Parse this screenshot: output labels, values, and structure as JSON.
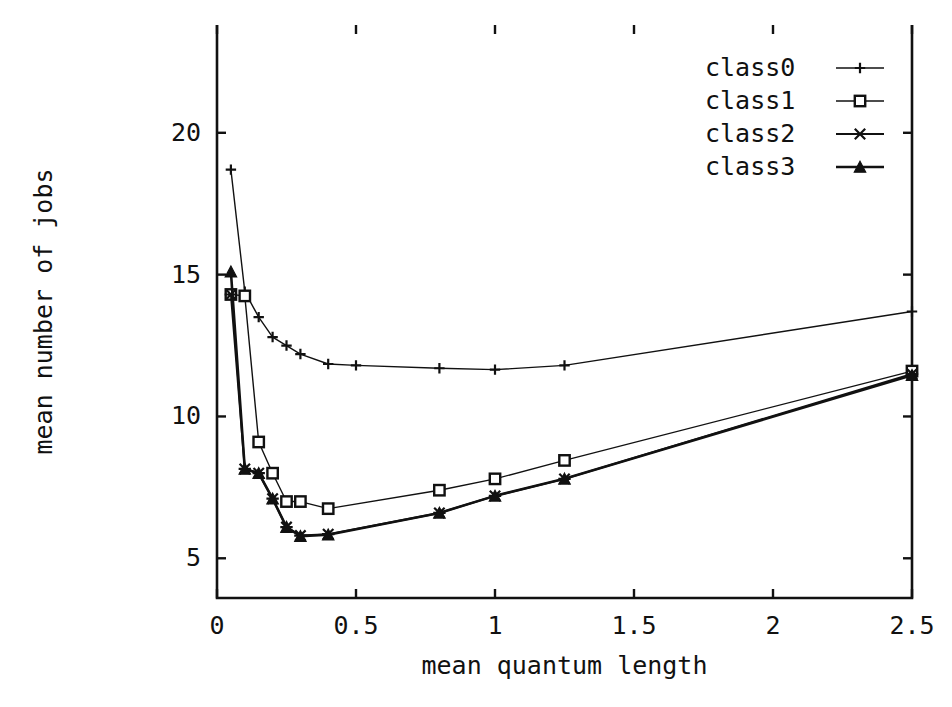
{
  "chart_data": {
    "type": "line",
    "title": "",
    "xlabel": "mean quantum length",
    "ylabel": "mean number of jobs",
    "xlim": [
      0,
      2.5
    ],
    "ylim": [
      3.6,
      23.8
    ],
    "xticks": [
      0,
      0.5,
      1,
      1.5,
      2,
      2.5
    ],
    "xtick_labels": [
      "0",
      "0.5",
      "1",
      "1.5",
      "2",
      "2.5"
    ],
    "yticks": [
      5,
      10,
      15,
      20
    ],
    "ytick_labels": [
      "5",
      "10",
      "15",
      "20"
    ],
    "grid": false,
    "legend_position": "top-right",
    "series": [
      {
        "name": "class0",
        "marker": "plus",
        "linewidth": 1.4,
        "x": [
          0.05,
          0.1,
          0.15,
          0.2,
          0.25,
          0.3,
          0.4,
          0.5,
          0.8,
          1.0,
          1.25,
          2.5
        ],
        "y": [
          18.7,
          14.4,
          13.5,
          12.8,
          12.5,
          12.2,
          11.85,
          11.8,
          11.7,
          11.65,
          11.8,
          13.7
        ]
      },
      {
        "name": "class1",
        "marker": "square",
        "linewidth": 1.4,
        "x": [
          0.05,
          0.1,
          0.15,
          0.2,
          0.25,
          0.3,
          0.4,
          0.8,
          1.0,
          1.25,
          2.5
        ],
        "y": [
          14.3,
          14.25,
          9.1,
          8.0,
          7.0,
          7.0,
          6.75,
          7.4,
          7.8,
          8.45,
          11.6
        ]
      },
      {
        "name": "class2",
        "marker": "star",
        "linewidth": 2.0,
        "x": [
          0.05,
          0.1,
          0.15,
          0.2,
          0.25,
          0.3,
          0.4,
          0.8,
          1.0,
          1.25,
          2.5
        ],
        "y": [
          14.3,
          8.15,
          8.0,
          7.1,
          6.1,
          5.8,
          5.85,
          6.6,
          7.2,
          7.8,
          11.5
        ]
      },
      {
        "name": "class3",
        "marker": "triangle",
        "linewidth": 2.6,
        "x": [
          0.05,
          0.1,
          0.15,
          0.2,
          0.25,
          0.3,
          0.4,
          0.8,
          1.0,
          1.25,
          2.5
        ],
        "y": [
          15.1,
          8.15,
          8.0,
          7.1,
          6.1,
          5.78,
          5.83,
          6.6,
          7.2,
          7.8,
          11.45
        ]
      }
    ]
  },
  "legend": {
    "entries": [
      {
        "label": "class0",
        "marker": "plus"
      },
      {
        "label": "class1",
        "marker": "square"
      },
      {
        "label": "class2",
        "marker": "star"
      },
      {
        "label": "class3",
        "marker": "triangle"
      }
    ]
  },
  "axes": {
    "x_axis_label": "mean quantum length",
    "y_axis_label": "mean number of jobs"
  },
  "colors": {
    "ink": "#111111",
    "background": "#ffffff"
  }
}
